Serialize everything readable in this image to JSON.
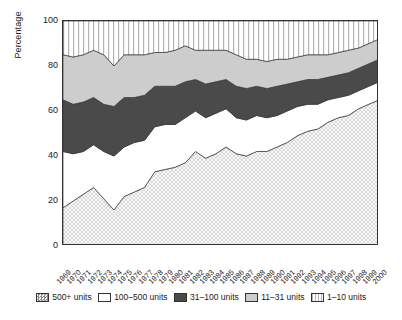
{
  "chart_data": {
    "type": "area",
    "title": "",
    "xlabel": "",
    "ylabel": "Percentage",
    "ylim": [
      0,
      100
    ],
    "yticks": [
      0,
      20,
      40,
      60,
      80,
      100
    ],
    "grid": false,
    "stacked": true,
    "legend_position": "bottom",
    "categories": [
      "1969",
      "1970",
      "1971",
      "1972",
      "1973",
      "1974",
      "1975",
      "1976",
      "1977",
      "1978",
      "1979",
      "1980",
      "1981",
      "1982",
      "1983",
      "1984",
      "1985",
      "1986",
      "1987",
      "1988",
      "1989",
      "1990",
      "1991",
      "1992",
      "1993",
      "1994",
      "1995",
      "1996",
      "1997",
      "1998",
      "1999",
      "2000"
    ],
    "series": [
      {
        "name": "500+ units",
        "fill": "dots",
        "color": "#f2f2f2",
        "values": [
          17,
          20,
          23,
          26,
          21,
          16,
          22,
          24,
          26,
          33,
          34,
          35,
          37,
          42,
          39,
          41,
          44,
          41,
          40,
          42,
          42,
          44,
          46,
          49,
          51,
          52,
          55,
          57,
          58,
          61,
          63,
          65
        ]
      },
      {
        "name": "100–500 units",
        "fill": "solid",
        "color": "#ffffff",
        "values": [
          25,
          21,
          19,
          19,
          21,
          24,
          22,
          22,
          21,
          20,
          20,
          19,
          20,
          18,
          18,
          18,
          17,
          16,
          16,
          16,
          15,
          14,
          14,
          13,
          12,
          11,
          10,
          9,
          9,
          8,
          8,
          8
        ]
      },
      {
        "name": "31–100 units",
        "fill": "solid",
        "color": "#4a4a4a",
        "values": [
          23,
          22,
          22,
          21,
          21,
          22,
          22,
          20,
          20,
          18,
          17,
          17,
          16,
          14,
          15,
          14,
          13,
          14,
          14,
          13,
          13,
          13,
          12,
          11,
          11,
          11,
          10,
          10,
          10,
          10,
          10,
          10
        ]
      },
      {
        "name": "11–31 units",
        "fill": "solid",
        "color": "#cdcdcd",
        "values": [
          20,
          21,
          21,
          21,
          22,
          18,
          19,
          19,
          18,
          15,
          15,
          16,
          16,
          13,
          15,
          14,
          13,
          14,
          13,
          12,
          12,
          12,
          11,
          11,
          11,
          11,
          10,
          10,
          10,
          9,
          9,
          9
        ]
      },
      {
        "name": "1–10 units",
        "fill": "stripes",
        "color": "#ffffff",
        "values": [
          15,
          16,
          15,
          13,
          15,
          20,
          15,
          15,
          15,
          14,
          14,
          13,
          11,
          13,
          13,
          13,
          13,
          15,
          17,
          17,
          18,
          17,
          17,
          16,
          15,
          15,
          15,
          14,
          13,
          12,
          10,
          8
        ]
      }
    ]
  },
  "axis": {
    "y_title": "Percentage"
  },
  "legend": {
    "items": [
      {
        "label": "500+ units",
        "swatch": "dots"
      },
      {
        "label": "100–500 units",
        "swatch": "solid-white"
      },
      {
        "label": "31–100 units",
        "swatch": "solid-dark"
      },
      {
        "label": "11–31 units",
        "swatch": "solid-light"
      },
      {
        "label": "1–10 units",
        "swatch": "stripes"
      }
    ]
  }
}
